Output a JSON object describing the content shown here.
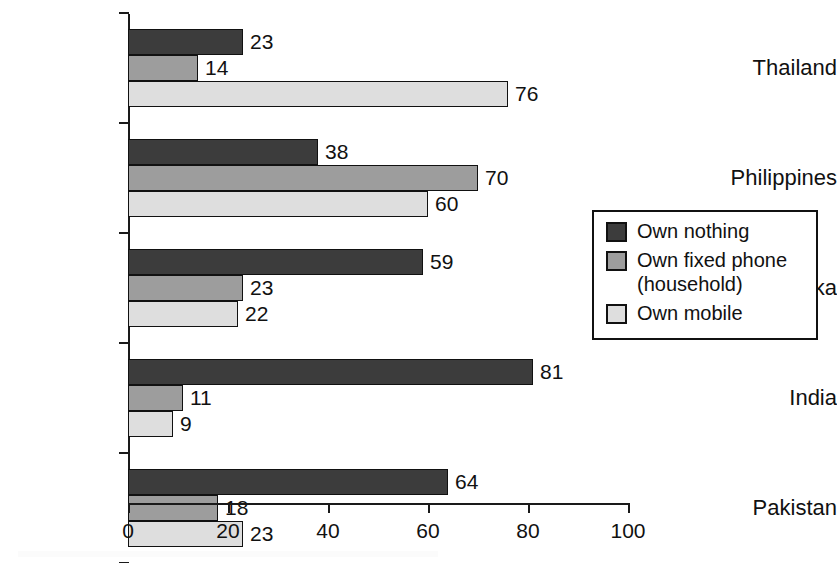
{
  "chart_data": {
    "type": "bar",
    "orientation": "horizontal",
    "title": "",
    "subtitle": "",
    "xlabel": "",
    "ylabel": "",
    "xlim": [
      0,
      100
    ],
    "xticks": [
      0,
      20,
      40,
      60,
      80,
      100
    ],
    "xtick_labels": [
      "0",
      "20",
      "40",
      "60",
      "80",
      "100"
    ],
    "grid": false,
    "legend_position": "right",
    "categories": [
      "Thailand",
      "Philippines",
      "Sri Lanka",
      "India",
      "Pakistan"
    ],
    "series": [
      {
        "name": "Own nothing",
        "color": "#3c3c3c",
        "values": [
          23,
          38,
          59,
          81,
          64
        ]
      },
      {
        "name": "Own fixed phone (household)",
        "legend_label": "Own fixed phone\n(household)",
        "color": "#9d9d9d",
        "values": [
          14,
          70,
          23,
          11,
          18
        ]
      },
      {
        "name": "Own mobile",
        "color": "#dedede",
        "values": [
          76,
          60,
          22,
          9,
          23
        ]
      }
    ],
    "data_labels": [
      {
        "category": "Thailand",
        "series": "Own nothing",
        "value": 23,
        "label": "23"
      },
      {
        "category": "Thailand",
        "series": "Own fixed phone (household)",
        "value": 14,
        "label": "14"
      },
      {
        "category": "Thailand",
        "series": "Own mobile",
        "value": 76,
        "label": "76"
      },
      {
        "category": "Philippines",
        "series": "Own nothing",
        "value": 38,
        "label": "38"
      },
      {
        "category": "Philippines",
        "series": "Own fixed phone (household)",
        "value": 70,
        "label": "70"
      },
      {
        "category": "Philippines",
        "series": "Own mobile",
        "value": 60,
        "label": "60"
      },
      {
        "category": "Sri Lanka",
        "series": "Own nothing",
        "value": 59,
        "label": "59"
      },
      {
        "category": "Sri Lanka",
        "series": "Own fixed phone (household)",
        "value": 23,
        "label": "23"
      },
      {
        "category": "Sri Lanka",
        "series": "Own mobile",
        "value": 22,
        "label": "22"
      },
      {
        "category": "India",
        "series": "Own nothing",
        "value": 81,
        "label": "81"
      },
      {
        "category": "India",
        "series": "Own fixed phone (household)",
        "value": 11,
        "label": "11"
      },
      {
        "category": "India",
        "series": "Own mobile",
        "value": 9,
        "label": "9"
      },
      {
        "category": "Pakistan",
        "series": "Own nothing",
        "value": 64,
        "label": "64"
      },
      {
        "category": "Pakistan",
        "series": "Own fixed phone (household)",
        "value": 18,
        "label": "18"
      },
      {
        "category": "Pakistan",
        "series": "Own mobile",
        "value": 23,
        "label": "23"
      }
    ]
  },
  "legend": {
    "items": [
      {
        "label": "Own nothing",
        "color": "#3c3c3c"
      },
      {
        "label": "Own fixed phone\n(household)",
        "color": "#9d9d9d"
      },
      {
        "label": "Own mobile",
        "color": "#dedede"
      }
    ]
  },
  "axis": {
    "x_tick_labels": [
      "0",
      "20",
      "40",
      "60",
      "80",
      "100"
    ],
    "y_tick_labels": [
      "Thailand",
      "Philippines",
      "Sri Lanka",
      "India",
      "Pakistan"
    ]
  }
}
